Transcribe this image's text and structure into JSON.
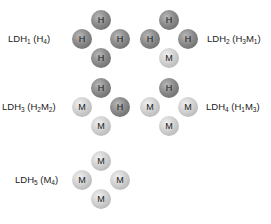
{
  "isozymes": [
    {
      "name": "LDH",
      "num": "1",
      "formula": [
        {
          "t": "H"
        },
        {
          "s": "4"
        }
      ],
      "subunits": [
        "H",
        "H",
        "H",
        "H"
      ],
      "label_pos": [
        8,
        33
      ],
      "center": [
        101,
        39
      ],
      "label_side": "left"
    },
    {
      "name": "LDH",
      "num": "2",
      "formula": [
        {
          "t": "H"
        },
        {
          "s": "3"
        },
        {
          "t": "M"
        },
        {
          "s": "1"
        }
      ],
      "subunits": [
        "H",
        "H",
        "H",
        "M"
      ],
      "label_pos": [
        207,
        33
      ],
      "center": [
        169,
        39
      ],
      "label_side": "right"
    },
    {
      "name": "LDH",
      "num": "3",
      "formula": [
        {
          "t": "H"
        },
        {
          "s": "2"
        },
        {
          "t": "M"
        },
        {
          "s": "2"
        }
      ],
      "subunits": [
        "H",
        "M",
        "H",
        "M"
      ],
      "label_pos": [
        2,
        101
      ],
      "center": [
        101,
        107
      ],
      "label_side": "left"
    },
    {
      "name": "LDH",
      "num": "4",
      "formula": [
        {
          "t": "H"
        },
        {
          "s": "1"
        },
        {
          "t": "M"
        },
        {
          "s": "3"
        }
      ],
      "subunits": [
        "H",
        "M",
        "M",
        "M"
      ],
      "label_pos": [
        206,
        101
      ],
      "center": [
        169,
        107
      ],
      "label_side": "right"
    },
    {
      "name": "LDH",
      "num": "5",
      "formula": [
        {
          "t": "M"
        },
        {
          "s": "4"
        }
      ],
      "subunits": [
        "M",
        "M",
        "M",
        "M"
      ],
      "label_pos": [
        15,
        174
      ],
      "center": [
        101,
        180
      ],
      "label_side": "left"
    }
  ],
  "subunit_colors": {
    "H": "#8a8a8a",
    "M": "#d0d0d0"
  }
}
